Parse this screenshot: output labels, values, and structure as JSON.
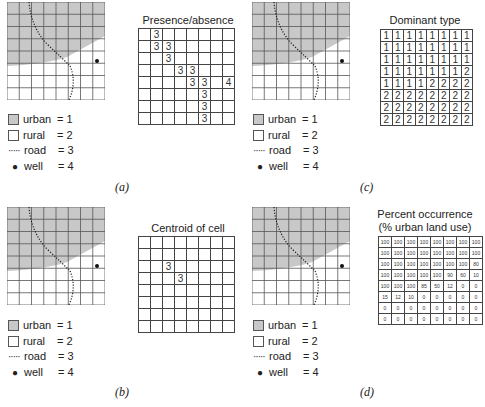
{
  "panels": [
    {
      "id": "a",
      "label": "(a)",
      "title": "Presence/absence",
      "grid_type": "sparse",
      "cells": [
        [
          "",
          "3",
          "",
          "",
          "",
          "",
          "",
          ""
        ],
        [
          "",
          "3",
          "3",
          "",
          "",
          "",
          "",
          ""
        ],
        [
          "",
          "",
          "3",
          "",
          "",
          "",
          "",
          ""
        ],
        [
          "",
          "",
          "",
          "3",
          "3",
          "",
          "",
          ""
        ],
        [
          "",
          "",
          "",
          "",
          "3",
          "3",
          "",
          "4"
        ],
        [
          "",
          "",
          "",
          "",
          "",
          "3",
          "",
          ""
        ],
        [
          "",
          "",
          "",
          "",
          "",
          "3",
          "",
          ""
        ],
        [
          "",
          "",
          "",
          "",
          "",
          "3",
          "",
          ""
        ]
      ]
    },
    {
      "id": "b",
      "label": "(b)",
      "title": "Centroid of cell",
      "grid_type": "sparse",
      "cells": [
        [
          "",
          "",
          "",
          "",
          "",
          "",
          "",
          ""
        ],
        [
          "",
          "",
          "",
          "",
          "",
          "",
          "",
          ""
        ],
        [
          "",
          "",
          "3",
          "",
          "",
          "",
          "",
          ""
        ],
        [
          "",
          "",
          "",
          "3",
          "",
          "",
          "",
          ""
        ],
        [
          "",
          "",
          "",
          "",
          "",
          "",
          "",
          ""
        ],
        [
          "",
          "",
          "",
          "",
          "",
          "",
          "",
          ""
        ],
        [
          "",
          "",
          "",
          "",
          "",
          "",
          "",
          ""
        ],
        [
          "",
          "",
          "",
          "",
          "",
          "",
          "",
          ""
        ]
      ]
    },
    {
      "id": "c",
      "label": "(c)",
      "title": "Dominant type",
      "grid_type": "full",
      "cells": [
        [
          "1",
          "1",
          "1",
          "1",
          "1",
          "1",
          "1",
          "1"
        ],
        [
          "1",
          "1",
          "1",
          "1",
          "1",
          "1",
          "1",
          "1"
        ],
        [
          "1",
          "1",
          "1",
          "1",
          "1",
          "1",
          "1",
          "1"
        ],
        [
          "1",
          "1",
          "1",
          "1",
          "1",
          "1",
          "1",
          "2"
        ],
        [
          "1",
          "1",
          "1",
          "1",
          "2",
          "2",
          "2",
          "2"
        ],
        [
          "2",
          "2",
          "2",
          "2",
          "2",
          "2",
          "2",
          "2"
        ],
        [
          "2",
          "2",
          "2",
          "2",
          "2",
          "2",
          "2",
          "2"
        ],
        [
          "2",
          "2",
          "2",
          "2",
          "2",
          "2",
          "2",
          "2"
        ]
      ]
    },
    {
      "id": "d",
      "label": "(d)",
      "title": "Percent occurrence",
      "subtitle": "(% urban land use)",
      "grid_type": "percent",
      "cells": [
        [
          "100",
          "100",
          "100",
          "100",
          "100",
          "100",
          "100",
          "100"
        ],
        [
          "100",
          "100",
          "100",
          "100",
          "100",
          "100",
          "100",
          "100"
        ],
        [
          "100",
          "100",
          "100",
          "100",
          "100",
          "100",
          "100",
          "80"
        ],
        [
          "100",
          "100",
          "100",
          "100",
          "100",
          "90",
          "60",
          "10"
        ],
        [
          "100",
          "100",
          "100",
          "85",
          "50",
          "12",
          "0",
          "0"
        ],
        [
          "15",
          "12",
          "10",
          "0",
          "0",
          "0",
          "0",
          "0"
        ],
        [
          "0",
          "0",
          "0",
          "0",
          "0",
          "0",
          "0",
          "0"
        ],
        [
          "0",
          "0",
          "0",
          "0",
          "0",
          "0",
          "0",
          "0"
        ]
      ]
    }
  ],
  "legend": [
    {
      "symbol": "urban-swatch",
      "name": "urban",
      "value": "= 1"
    },
    {
      "symbol": "rural-swatch",
      "name": "rural",
      "value": "= 2"
    },
    {
      "symbol": "road-line",
      "name": "road",
      "value": "= 3"
    },
    {
      "symbol": "well-dot",
      "name": "well",
      "value": "= 4"
    }
  ],
  "colors": {
    "urban": "#c8c8c8",
    "rural": "#ffffff",
    "grid": "#444444"
  },
  "caption": "Figure 5.5  ..."
}
